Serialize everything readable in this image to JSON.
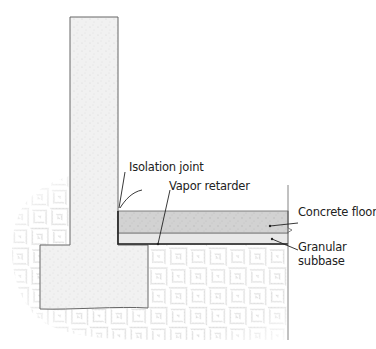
{
  "diagram": {
    "type": "cross-section",
    "labels": {
      "isolation_joint": "Isolation joint",
      "vapor_retarder": "Vapor retarder",
      "concrete_floor": "Concrete floor",
      "granular_subbase_line1": "Granular",
      "granular_subbase_line2": "subbase"
    },
    "colors": {
      "soil_hatch": "#b8b8b8",
      "concrete_wall": "#efefef",
      "concrete_floor": "#cfcfcf",
      "subbase": "#e6e6e6",
      "outline": "#555555",
      "vapor_retarder": "#222222"
    }
  }
}
